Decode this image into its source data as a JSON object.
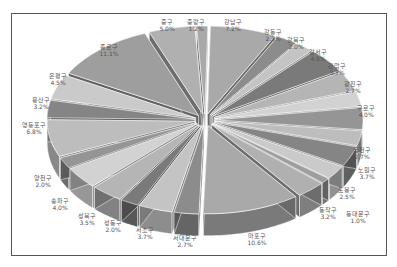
{
  "chart_data": {
    "type": "pie",
    "style": "3d-exploded",
    "title": "",
    "legend": "none",
    "slices": [
      {
        "label": "강남구",
        "value": 7.2,
        "display": "7.2%"
      },
      {
        "label": "강동구",
        "value": 2.3,
        "display": "2.3%"
      },
      {
        "label": "강북구",
        "value": 2.0,
        "display": "2.0%"
      },
      {
        "label": "강서구",
        "value": 4.5,
        "display": "4.5%"
      },
      {
        "label": "관악구",
        "value": 3.7,
        "display": "3.7%"
      },
      {
        "label": "광진구",
        "value": 2.7,
        "display": "2.7%"
      },
      {
        "label": "구로구",
        "value": 4.0,
        "display": "4.0%"
      },
      {
        "label": "금천구",
        "value": 2.7,
        "display": "2.7%"
      },
      {
        "label": "노원구",
        "value": 3.7,
        "display": "3.7%"
      },
      {
        "label": "도봉구",
        "value": 2.5,
        "display": "2.5%"
      },
      {
        "label": "동대문구",
        "value": 1.0,
        "display": "1.0%"
      },
      {
        "label": "동작구",
        "value": 3.2,
        "display": "3.2%"
      },
      {
        "label": "마포구",
        "value": 10.6,
        "display": "10.6%"
      },
      {
        "label": "서대문구",
        "value": 2.7,
        "display": "2.7%"
      },
      {
        "label": "서초구",
        "value": 3.7,
        "display": "3.7%"
      },
      {
        "label": "성동구",
        "value": 2.0,
        "display": "2.0%"
      },
      {
        "label": "성북구",
        "value": 3.5,
        "display": "3.5%"
      },
      {
        "label": "송파구",
        "value": 4.0,
        "display": "4.0%"
      },
      {
        "label": "양천구",
        "value": 2.0,
        "display": "2.0%"
      },
      {
        "label": "영등포구",
        "value": 6.8,
        "display": "6.8%"
      },
      {
        "label": "용산구",
        "value": 3.2,
        "display": "3.2%"
      },
      {
        "label": "은평구",
        "value": 4.5,
        "display": "4.5%"
      },
      {
        "label": "종로구",
        "value": 11.1,
        "display": "11.1%"
      },
      {
        "label": "중구",
        "value": 5.0,
        "display": "5.0%"
      },
      {
        "label": "중랑구",
        "value": 1.2,
        "display": "1.2%"
      }
    ]
  },
  "labels": [
    {
      "name": "강남구",
      "pct": "7.2%",
      "x": 233,
      "y": 18
    },
    {
      "name": "강동구",
      "pct": "2.3%",
      "x": 273,
      "y": 28
    },
    {
      "name": "강북구",
      "pct": "2.0%",
      "x": 296,
      "y": 36
    },
    {
      "name": "강서구",
      "pct": "4.5%",
      "x": 318,
      "y": 48
    },
    {
      "name": "관악구",
      "pct": "3.7%",
      "x": 337,
      "y": 62
    },
    {
      "name": "광진구",
      "pct": "2.7%",
      "x": 353,
      "y": 80
    },
    {
      "name": "구로구",
      "pct": "4.0%",
      "x": 366,
      "y": 104
    },
    {
      "name": "금천구",
      "pct": "2.7%",
      "x": 362,
      "y": 146
    },
    {
      "name": "노원구",
      "pct": "3.7%",
      "x": 367,
      "y": 166
    },
    {
      "name": "도봉구",
      "pct": "2.5%",
      "x": 347,
      "y": 186
    },
    {
      "name": "동대문구",
      "pct": "1.0%",
      "x": 358,
      "y": 210
    },
    {
      "name": "동작구",
      "pct": "3.2%",
      "x": 328,
      "y": 206
    },
    {
      "name": "마포구",
      "pct": "10.6%",
      "x": 257,
      "y": 232
    },
    {
      "name": "서대문구",
      "pct": "2.7%",
      "x": 185,
      "y": 234
    },
    {
      "name": "서초구",
      "pct": "3.7%",
      "x": 145,
      "y": 226
    },
    {
      "name": "성동구",
      "pct": "2.0%",
      "x": 113,
      "y": 219
    },
    {
      "name": "성북구",
      "pct": "3.5%",
      "x": 87,
      "y": 212
    },
    {
      "name": "송파구",
      "pct": "4.0%",
      "x": 60,
      "y": 197
    },
    {
      "name": "양천구",
      "pct": "2.0%",
      "x": 43,
      "y": 174
    },
    {
      "name": "영등포구",
      "pct": "6.8%",
      "x": 34,
      "y": 121
    },
    {
      "name": "용산구",
      "pct": "3.2%",
      "x": 41,
      "y": 96
    },
    {
      "name": "은평구",
      "pct": "4.5%",
      "x": 58,
      "y": 72
    },
    {
      "name": "종로구",
      "pct": "11.1%",
      "x": 109,
      "y": 43
    },
    {
      "name": "중구",
      "pct": "5.0%",
      "x": 167,
      "y": 18
    },
    {
      "name": "중랑구",
      "pct": "1.2%",
      "x": 196,
      "y": 18
    }
  ]
}
